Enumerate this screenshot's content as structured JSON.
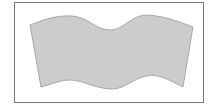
{
  "diagram": {
    "frame": {
      "x": 14.5,
      "y": 2.5,
      "width": 189,
      "height": 100,
      "stroke": "#777777",
      "fill": "#ffffff"
    },
    "shape": {
      "name": "wavy-quadrilateral",
      "fill": "#cccccc",
      "stroke": "#999999",
      "path": "M30,25 C45,19 58,15 72,16 C88,17 96,30 110,30 C124,30 132,14 148,15 C164,16 180,22 193,27 L183,87 C172,82 160,73 146,76 C132,79 124,90 110,89 C94,88 82,80 70,80 C60,80 50,85 41,87 Z"
    }
  }
}
